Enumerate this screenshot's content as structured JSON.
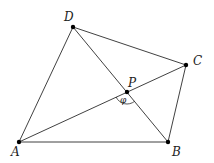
{
  "diagram": {
    "type": "geometry",
    "points": {
      "A": {
        "x": 19,
        "y": 142,
        "label": "A",
        "label_x": 11,
        "label_y": 156
      },
      "B": {
        "x": 168,
        "y": 142,
        "label": "B",
        "label_x": 172,
        "label_y": 156
      },
      "C": {
        "x": 186,
        "y": 65,
        "label": "C",
        "label_x": 193,
        "label_y": 65
      },
      "D": {
        "x": 73,
        "y": 27,
        "label": "D",
        "label_x": 64,
        "label_y": 21
      },
      "P": {
        "x": 127,
        "y": 92,
        "label": "P",
        "label_x": 128,
        "label_y": 87
      }
    },
    "edges": [
      [
        "A",
        "B"
      ],
      [
        "B",
        "C"
      ],
      [
        "C",
        "D"
      ],
      [
        "D",
        "A"
      ],
      [
        "A",
        "C"
      ],
      [
        "B",
        "D"
      ]
    ],
    "angle": {
      "vertex": "P",
      "symbol": "φ",
      "between": [
        "A",
        "B"
      ],
      "radius": 12,
      "symbol_x": 120,
      "symbol_y": 103
    }
  }
}
